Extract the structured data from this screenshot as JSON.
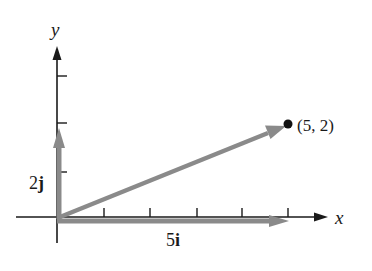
{
  "diagram": {
    "type": "vector-decomposition",
    "axes": {
      "x_label": "x",
      "y_label": "y",
      "x_ticks": [
        1,
        2,
        3,
        4,
        5
      ],
      "y_ticks": [
        1,
        2,
        3
      ]
    },
    "point": {
      "coords": [
        5,
        2
      ],
      "label": "(5, 2)"
    },
    "vectors": [
      {
        "name": "horizontal-component",
        "from": [
          0,
          0
        ],
        "to": [
          5,
          0
        ],
        "label_coef": "5",
        "label_unit": "i"
      },
      {
        "name": "vertical-component",
        "from": [
          0,
          0
        ],
        "to": [
          0,
          2
        ],
        "label_coef": "2",
        "label_unit": "j"
      },
      {
        "name": "resultant",
        "from": [
          0,
          0
        ],
        "to": [
          5,
          2
        ]
      }
    ],
    "colors": {
      "axis": "#1a1a1a",
      "vector": "#8a8a8a",
      "point": "#111111",
      "background": "#ffffff"
    }
  }
}
